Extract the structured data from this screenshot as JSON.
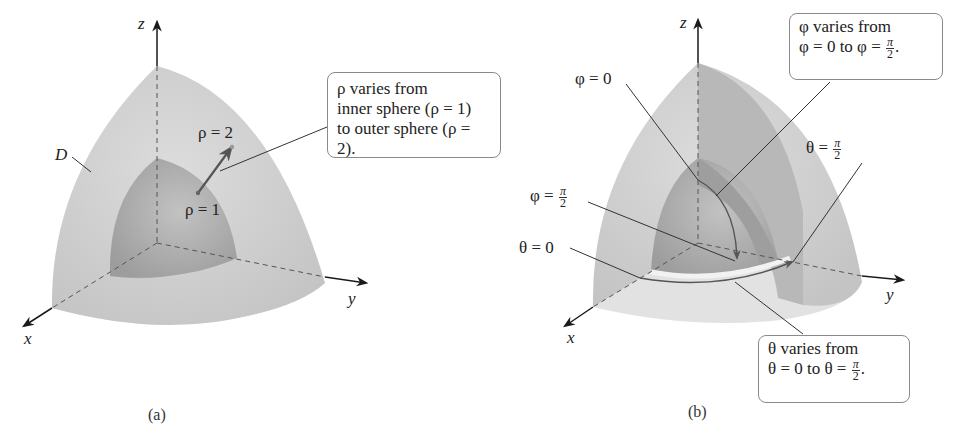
{
  "figure": {
    "panel_a": {
      "caption": "(a)",
      "axes": {
        "x": "x",
        "y": "y",
        "z": "z"
      },
      "region_label": "D",
      "inner_label": "ρ = 1",
      "outer_label": "ρ = 2",
      "callout": {
        "line1": "ρ varies from",
        "line2": "inner sphere (ρ = 1)",
        "line3": "to outer sphere (ρ = 2)."
      }
    },
    "panel_b": {
      "caption": "(b)",
      "axes": {
        "x": "x",
        "y": "y",
        "z": "z"
      },
      "phi_zero_label": "φ = 0",
      "phi_half_pi_label_prefix": "φ =",
      "theta_zero_label": "θ = 0",
      "theta_half_pi_label_prefix": "θ =",
      "pi": "π",
      "two": "2",
      "phi_callout": {
        "line1": "φ varies from",
        "line2_prefix": "φ = 0 to φ =",
        "line2_suffix": "."
      },
      "theta_callout": {
        "line1": "θ varies from",
        "line2_prefix": "θ = 0 to θ =",
        "line2_suffix": "."
      }
    },
    "colors": {
      "outer_shell": "#d2d2d2",
      "inner_sphere": "#b4b4b4",
      "floor": "#e4e4e4",
      "axis": "#1a1a1a",
      "leader": "#4a4a4a",
      "callout_border": "#8a8a8a"
    }
  }
}
